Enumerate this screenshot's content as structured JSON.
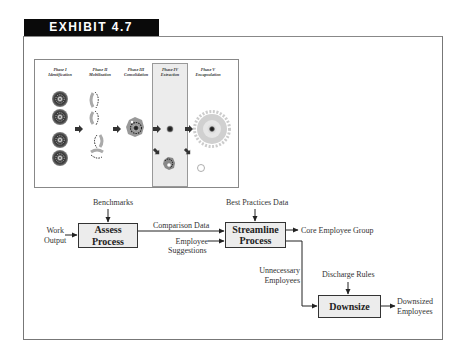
{
  "exhibit": {
    "title": "EXHIBIT 4.7"
  },
  "illustration": {
    "phases": [
      {
        "numeral": "Phase I",
        "name": "Identification"
      },
      {
        "numeral": "Phase II",
        "name": "Mobilization"
      },
      {
        "numeral": "Phase III",
        "name": "Consolidation"
      },
      {
        "numeral": "Phase IV",
        "name": "Extraction"
      },
      {
        "numeral": "Phase V",
        "name": "Encapsulation"
      }
    ]
  },
  "flowchart": {
    "inputs": {
      "work_output_line1": "Work",
      "work_output_line2": "Output",
      "benchmarks": "Benchmarks",
      "best_practices": "Best Practices Data",
      "employee_suggestions_line1": "Employee",
      "employee_suggestions_line2": "Suggestions",
      "discharge_rules": "Discharge Rules"
    },
    "boxes": {
      "assess_line1": "Assess",
      "assess_line2": "Process",
      "streamline_line1": "Streamline",
      "streamline_line2": "Process",
      "downsize": "Downsize"
    },
    "flows": {
      "comparison_data": "Comparison Data",
      "core_group": "Core Employee Group",
      "unnecessary_line1": "Unnecessary",
      "unnecessary_line2": "Employees",
      "downsized_line1": "Downsized",
      "downsized_line2": "Employees"
    }
  },
  "colors": {
    "tab_bg": "#0a0a0a",
    "box_fill": "#ececec",
    "highlight_column": "#ececec"
  }
}
